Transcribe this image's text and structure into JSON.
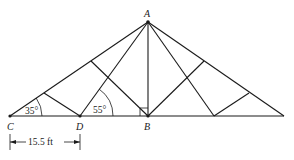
{
  "diagram": {
    "type": "roof-truss",
    "points": {
      "A": "A",
      "B": "B",
      "C": "C",
      "D": "D"
    },
    "angles": {
      "angle_C": "35°",
      "angle_D": "55°"
    },
    "dimension": {
      "label": "15.5 ft",
      "from": "C",
      "to": "D"
    },
    "right_angle_at": "B",
    "line_color": "#1a1a1a"
  }
}
